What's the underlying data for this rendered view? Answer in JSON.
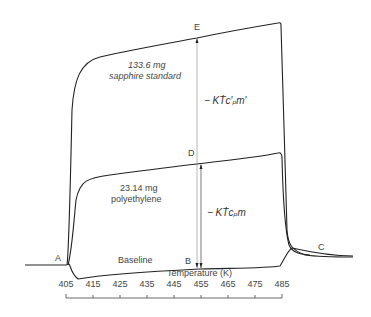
{
  "diagram": {
    "points": {
      "A": "A",
      "B": "B",
      "C": "C",
      "D": "D",
      "E": "E"
    },
    "labels": {
      "sapphire_mass": "133.6 mg",
      "sapphire_name": "sapphire standard",
      "poly_mass": "23.14 mg",
      "poly_name": "polyethylene",
      "baseline": "Baseline",
      "formula_sapphire": "− KṪc′ₚm′",
      "formula_poly": "− KṪcₚm"
    },
    "axis": {
      "title": "Temperature (K)",
      "ticks": [
        "405",
        "415",
        "425",
        "435",
        "445",
        "455",
        "465",
        "475",
        "485"
      ]
    },
    "line_color": "#222222"
  }
}
